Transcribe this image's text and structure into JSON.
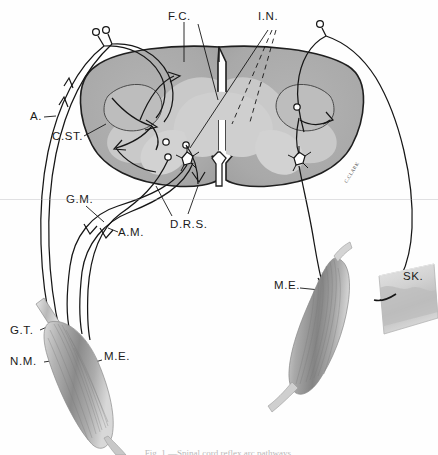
{
  "figure": {
    "signature": "C.CLARK",
    "caption": "Fig. 1.—Spinal cord reflex arc pathways.",
    "canvas": {
      "width": 438,
      "height": 455
    }
  },
  "colors": {
    "white_matter": "#ababab",
    "gray_matter": "#c9c9c9",
    "gray_matter_light": "#d5d5d5",
    "outline": "#1f1f1f",
    "fiber": "#161616",
    "muscle_dark": "#6e6e6e",
    "muscle_mid": "#9a9a9a",
    "muscle_light": "#d0d0d0",
    "skin": "#cfcfcf",
    "skin_light": "#e3e3e3",
    "label_text": "#1a1a1a",
    "background": "#fefefe"
  },
  "labels": [
    {
      "id": "fc",
      "text": "F.C.",
      "x": 168,
      "y": 10,
      "name": "label-fc"
    },
    {
      "id": "in",
      "text": "I.N.",
      "x": 258,
      "y": 10,
      "name": "label-in"
    },
    {
      "id": "a",
      "text": "A.",
      "x": 32,
      "y": 114,
      "name": "label-a"
    },
    {
      "id": "cst",
      "text": "C.ST.",
      "x": 54,
      "y": 134,
      "name": "label-cst"
    },
    {
      "id": "gm",
      "text": "G.M.",
      "x": 68,
      "y": 196,
      "name": "label-gm"
    },
    {
      "id": "am",
      "text": "A.M.",
      "x": 118,
      "y": 228,
      "name": "label-am"
    },
    {
      "id": "drs",
      "text": "D.R.S.",
      "x": 172,
      "y": 222,
      "name": "label-drs"
    },
    {
      "id": "gt",
      "text": "G.T.",
      "x": 12,
      "y": 329,
      "name": "label-gt"
    },
    {
      "id": "nm",
      "text": "N.M.",
      "x": 12,
      "y": 359,
      "name": "label-nm"
    },
    {
      "id": "me_left",
      "text": "M.E.",
      "x": 104,
      "y": 354,
      "name": "label-me-left"
    },
    {
      "id": "me_right",
      "text": "M.E.",
      "x": 276,
      "y": 283,
      "name": "label-me-right"
    },
    {
      "id": "sk",
      "text": "SK.",
      "x": 404,
      "y": 274,
      "name": "label-sk"
    }
  ],
  "legend_keys": [
    {
      "abbr": "F.C.",
      "meaning": "Funiculus / fasciculus cuneatus"
    },
    {
      "abbr": "I.N.",
      "meaning": "Internuncial neuron"
    },
    {
      "abbr": "A.",
      "meaning": "Afferent fiber"
    },
    {
      "abbr": "C.ST.",
      "meaning": "Corticospinal tract"
    },
    {
      "abbr": "G.M.",
      "meaning": "Gamma motor fiber"
    },
    {
      "abbr": "A.M.",
      "meaning": "Alpha motor fiber"
    },
    {
      "abbr": "D.R.S.",
      "meaning": "Dorsal root / spinal segment"
    },
    {
      "abbr": "G.T.",
      "meaning": "Golgi tendon organ"
    },
    {
      "abbr": "N.M.",
      "meaning": "Neuromuscular spindle"
    },
    {
      "abbr": "M.E.",
      "meaning": "Motor end plate"
    },
    {
      "abbr": "SK.",
      "meaning": "Skin"
    }
  ],
  "structures": [
    {
      "id": "cord",
      "name": "spinal-cord-cross-section"
    },
    {
      "id": "muscle_left",
      "name": "muscle-left"
    },
    {
      "id": "muscle_right",
      "name": "muscle-right"
    },
    {
      "id": "skin_patch",
      "name": "skin-patch"
    }
  ]
}
